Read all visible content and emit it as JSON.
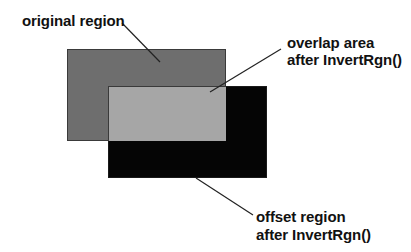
{
  "diagram": {
    "labels": {
      "original": "original region",
      "overlap_line1": "overlap area",
      "overlap_line2": "after InvertRgn()",
      "offset_line1": "offset region",
      "offset_line2": "after InvertRgn()"
    },
    "regions": {
      "original": {
        "x": 67,
        "y": 49,
        "w": 159,
        "h": 92,
        "color": "#6e6e6e"
      },
      "offset": {
        "x": 108,
        "y": 86,
        "w": 159,
        "h": 92,
        "color": "#050505"
      },
      "overlap": {
        "x": 108,
        "y": 86,
        "w": 118,
        "h": 55,
        "color": "#a6a6a6"
      }
    },
    "colors": {
      "background": "#ffffff",
      "text": "#111111",
      "leader_line": "#222222",
      "border": "#3a3a3a"
    }
  }
}
